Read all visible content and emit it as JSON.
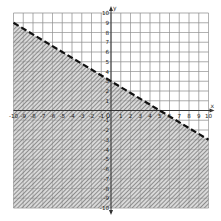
{
  "chart_data": {
    "type": "line",
    "title": "",
    "xlabel": "x",
    "ylabel": "y",
    "xlim": [
      -10,
      10
    ],
    "ylim": [
      -10,
      10
    ],
    "grid": true,
    "x_ticks": [
      -10,
      -9,
      -8,
      -7,
      -6,
      -5,
      -4,
      -3,
      -2,
      -1,
      1,
      2,
      3,
      4,
      5,
      6,
      7,
      8,
      9,
      10
    ],
    "y_ticks": [
      -10,
      -9,
      -8,
      -7,
      -6,
      -5,
      -4,
      -3,
      -2,
      -1,
      1,
      2,
      3,
      4,
      5,
      6,
      7,
      8,
      9,
      10
    ],
    "origin_label": "0",
    "boundary_line": {
      "equation": "y = -0.6x + 3",
      "style": "dashed",
      "points": [
        {
          "x": -10,
          "y": 9
        },
        {
          "x": 0,
          "y": 3
        },
        {
          "x": 5,
          "y": 0
        },
        {
          "x": 10,
          "y": -3
        }
      ]
    },
    "inequality": "3x + 5y < 15",
    "shaded_region": "below the line",
    "shading": "hatched"
  },
  "colors": {
    "grid": "#b8b8b8",
    "axis": "#333333",
    "boundary": "#111111",
    "hatch": "#555555",
    "background": "#ffffff"
  }
}
